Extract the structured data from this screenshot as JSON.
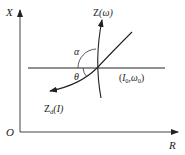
{
  "diagram": {
    "axes": {
      "y_label": "X",
      "x_label": "R",
      "origin_label": "O"
    },
    "curves": [
      {
        "id": "z-omega",
        "label_main": "Z",
        "label_arg": "(ω)"
      },
      {
        "id": "z-d-i",
        "label_main": "Z",
        "label_sub": "d",
        "label_arg": "(I)"
      }
    ],
    "angles": {
      "alpha": "α",
      "theta": "θ"
    },
    "operating_point": {
      "label_open": "(",
      "i_main": "I",
      "i_sub": "0",
      "sep": ",",
      "w_main": "ω",
      "w_sub": "0",
      "label_close": ")"
    },
    "colors": {
      "stroke": "#222222",
      "background": "#ffffff"
    }
  }
}
